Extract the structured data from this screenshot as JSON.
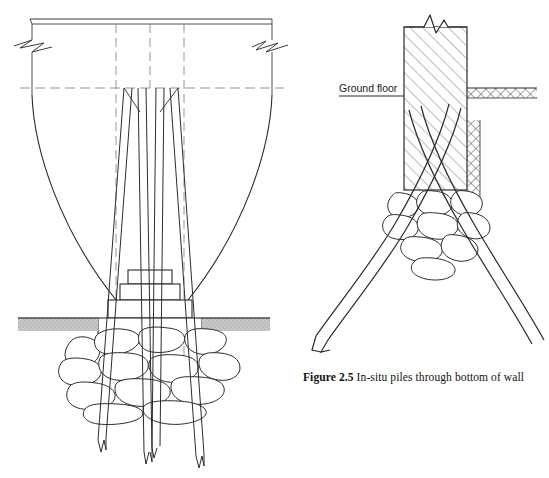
{
  "figure": {
    "caption_number": "Figure 2.5",
    "caption_text": " In-situ piles through bottom of wall",
    "caption_full": "Figure 2.5 In-situ piles through bottom of wall"
  },
  "annotations": {
    "ground_floor_label": "Ground floor"
  },
  "colors": {
    "line": "#1a1a1a",
    "thin_line": "#3a3a3a",
    "construction_line": "#7d7d7d",
    "ground_band": "#b9b9b9",
    "hatch": "#555555",
    "paper": "#ffffff"
  },
  "drawings": [
    {
      "id": "left-elevation",
      "name": "Elevation of wall with raking in-situ piles",
      "elements": [
        "wall-top-band",
        "break-symbol-left",
        "break-symbol-right",
        "arch-curve-left",
        "arch-curve-right",
        "centerline-vertical-left",
        "centerline-vertical-right",
        "centerline-horizontal",
        "stepped-footing",
        "ground-line-band",
        "rubble-foundation",
        "pile-1",
        "pile-2",
        "pile-3",
        "pile-4"
      ],
      "pile_count": 4
    },
    {
      "id": "right-section",
      "name": "Section through wall with crossing raking piles",
      "elements": [
        "wall-section-hatched",
        "break-symbol-top",
        "ground-floor-leader",
        "earth-hatch-upper",
        "earth-hatch-lower",
        "rubble-footing",
        "raking-pile-left",
        "raking-pile-right"
      ],
      "pile_count": 2
    }
  ]
}
